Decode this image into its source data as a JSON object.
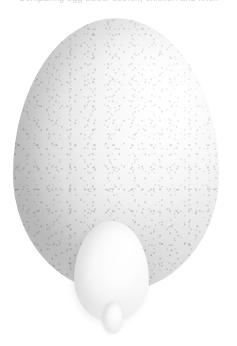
{
  "caption": {
    "text": "Comparing egg sizes: ostrich, chicken and finch"
  },
  "scene": {
    "title": "Three white eggs on a white background",
    "background_color": "#ffffff"
  },
  "objects": [
    {
      "name": "large-egg",
      "label": "Ostrich egg",
      "alt": "Large speckled off-white ostrich egg",
      "shell_color": "#f2f2f2",
      "shadow_color": "#949494",
      "highlight_color": "#ffffff",
      "texture": "speckled",
      "size_px": {
        "width": 206,
        "height": 274
      },
      "position_px": {
        "x": 13,
        "y": 18
      }
    },
    {
      "name": "medium-egg",
      "label": "Chicken egg",
      "alt": "Medium smooth white chicken egg in front of the ostrich egg",
      "shell_color": "#fdfdfd",
      "shadow_color": "#c6c6c6",
      "highlight_color": "#ffffff",
      "texture": "smooth",
      "size_px": {
        "width": 75,
        "height": 101
      },
      "position_px": {
        "x": 74,
        "y": 221
      }
    },
    {
      "name": "tiny-egg",
      "label": "Finch egg",
      "alt": "Tiny white egg at the base of the chicken egg",
      "shell_color": "#ffffff",
      "shadow_color": "#cccccc",
      "highlight_color": "#ffffff",
      "texture": "smooth",
      "size_px": {
        "width": 20,
        "height": 32
      },
      "position_px": {
        "x": 103,
        "y": 301
      }
    }
  ]
}
